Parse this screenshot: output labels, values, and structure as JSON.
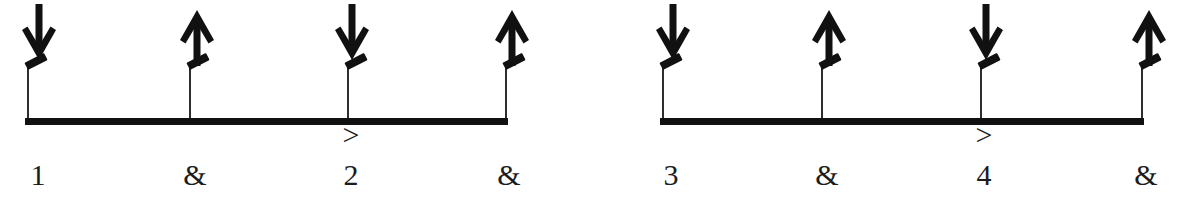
{
  "figure": {
    "background_color": "#ffffff",
    "ink_color": "#111111",
    "stem_color": "#2e2e2e",
    "accent_symbol": ">",
    "time_unit": "eighth notes"
  },
  "groups": [
    {
      "id": "group-1",
      "beam": {
        "x": 25,
        "y": 118,
        "width": 483,
        "height": 7
      },
      "notes": [
        {
          "count_label": "1",
          "stroke": "down",
          "arrow_glyph": "↓",
          "accent": false,
          "accent_symbol": "",
          "stem_x": 27,
          "stem_top": 68,
          "stem_height": 50,
          "arrow_x": 20,
          "arrow_y": 4,
          "label_x": 18,
          "label_y": 158
        },
        {
          "count_label": "&",
          "stroke": "up",
          "arrow_glyph": "↑",
          "accent": false,
          "accent_symbol": "",
          "stem_x": 189,
          "stem_top": 68,
          "stem_height": 50,
          "arrow_x": 178,
          "arrow_y": 4,
          "label_x": 175,
          "label_y": 158
        },
        {
          "count_label": "2",
          "stroke": "down",
          "arrow_glyph": "↓",
          "accent": true,
          "accent_symbol": ">",
          "stem_x": 347,
          "stem_top": 68,
          "stem_height": 50,
          "arrow_x": 333,
          "arrow_y": 4,
          "label_x": 331,
          "label_y": 158,
          "accent_x": 337,
          "accent_y": 122
        },
        {
          "count_label": "&",
          "stroke": "up",
          "arrow_glyph": "↑",
          "accent": false,
          "accent_symbol": "",
          "stem_x": 505,
          "stem_top": 68,
          "stem_height": 50,
          "arrow_x": 493,
          "arrow_y": 4,
          "label_x": 489,
          "label_y": 158
        }
      ]
    },
    {
      "id": "group-2",
      "beam": {
        "x": 660,
        "y": 118,
        "width": 484,
        "height": 7
      },
      "notes": [
        {
          "count_label": "3",
          "stroke": "down",
          "arrow_glyph": "↓",
          "accent": false,
          "accent_symbol": "",
          "stem_x": 662,
          "stem_top": 68,
          "stem_height": 50,
          "arrow_x": 654,
          "arrow_y": 4,
          "label_x": 651,
          "label_y": 158
        },
        {
          "count_label": "&",
          "stroke": "up",
          "arrow_glyph": "↑",
          "accent": false,
          "accent_symbol": "",
          "stem_x": 821,
          "stem_top": 68,
          "stem_height": 50,
          "arrow_x": 810,
          "arrow_y": 4,
          "label_x": 807,
          "label_y": 158
        },
        {
          "count_label": "4",
          "stroke": "down",
          "arrow_glyph": "↓",
          "accent": true,
          "accent_symbol": ">",
          "stem_x": 980,
          "stem_top": 68,
          "stem_height": 50,
          "arrow_x": 967,
          "arrow_y": 4,
          "label_x": 964,
          "label_y": 158,
          "accent_x": 970,
          "accent_y": 122
        },
        {
          "count_label": "&",
          "stroke": "up",
          "arrow_glyph": "↑",
          "accent": false,
          "accent_symbol": "",
          "stem_x": 1141,
          "stem_top": 68,
          "stem_height": 50,
          "arrow_x": 1130,
          "arrow_y": 4,
          "label_x": 1126,
          "label_y": 158
        }
      ]
    }
  ]
}
